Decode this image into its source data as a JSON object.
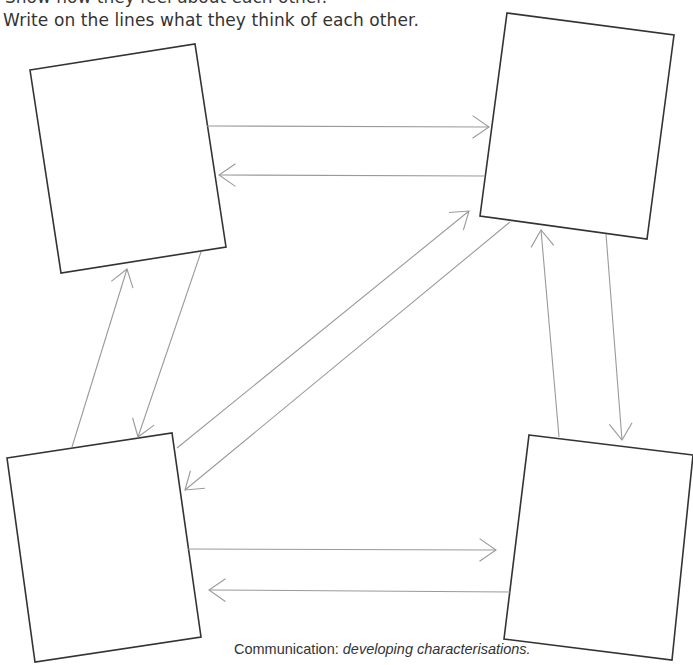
{
  "header": {
    "clipped_line": "Show how they feel about each other.",
    "instruction": "Write on the lines what they think of each other."
  },
  "colors": {
    "box_stroke": "#333333",
    "arrow_stroke": "#9a9a9a",
    "text": "#333333"
  },
  "diagram": {
    "boxes": [
      {
        "id": "top-left",
        "points": "30,70 195,44 226,247 61,273"
      },
      {
        "id": "top-right",
        "points": "507,13 674,35 647,239 480,216"
      },
      {
        "id": "bottom-left",
        "points": "7,458 172,433 201,637 35,662"
      },
      {
        "id": "bottom-right",
        "points": "529,435 693,455 672,660 504,639"
      }
    ],
    "arrows": [
      {
        "id": "top-left-to-top-right",
        "x1": 207,
        "y1": 126,
        "x2": 489,
        "y2": 127
      },
      {
        "id": "top-right-to-top-left",
        "x1": 485,
        "y1": 176,
        "x2": 219,
        "y2": 175
      },
      {
        "id": "bottom-left-to-top-right",
        "x1": 177,
        "y1": 448,
        "x2": 469,
        "y2": 211
      },
      {
        "id": "top-right-to-bottom-left",
        "x1": 510,
        "y1": 222,
        "x2": 185,
        "y2": 490
      },
      {
        "id": "bottom-left-to-top-left",
        "x1": 72,
        "y1": 447,
        "x2": 127,
        "y2": 269
      },
      {
        "id": "top-left-to-bottom-left",
        "x1": 201,
        "y1": 252,
        "x2": 138,
        "y2": 437
      },
      {
        "id": "bottom-right-to-top-right",
        "x1": 559,
        "y1": 437,
        "x2": 541,
        "y2": 230
      },
      {
        "id": "top-right-to-bottom-right",
        "x1": 606,
        "y1": 234,
        "x2": 622,
        "y2": 440
      },
      {
        "id": "bottom-left-to-bottom-right",
        "x1": 188,
        "y1": 549,
        "x2": 496,
        "y2": 550
      },
      {
        "id": "bottom-right-to-bottom-left",
        "x1": 510,
        "y1": 592,
        "x2": 209,
        "y2": 590
      }
    ]
  },
  "footer": {
    "label": "Communication:",
    "italic": "developing characterisations."
  }
}
